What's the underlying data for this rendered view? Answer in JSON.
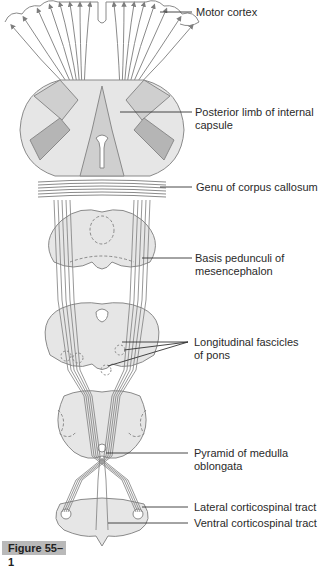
{
  "figure": {
    "caption": "Figure 55–1",
    "colors": {
      "outline": "#8a8a8a",
      "fill_light": "#e6e6e6",
      "fill_mid": "#cfcfcf",
      "fill_dark": "#b5b5b5",
      "fiber": "#7d7d7d",
      "leader_line": "#333333",
      "caption_bg": "#b9b9b9"
    }
  },
  "labels": [
    {
      "id": "motor-cortex",
      "text": "Motor cortex"
    },
    {
      "id": "posterior-limb",
      "text": "Posterior limb of internal",
      "text2": "capsule"
    },
    {
      "id": "genu",
      "text": "Genu of corpus callosum"
    },
    {
      "id": "basis-pedunculi",
      "text": "Basis pedunculi of",
      "text2": "mesencephalon"
    },
    {
      "id": "longitudinal-fascicles",
      "text": "Longitudinal fascicles",
      "text2": "of pons"
    },
    {
      "id": "pyramid",
      "text": "Pyramid of medulla",
      "text2": "oblongata"
    },
    {
      "id": "lateral-cst",
      "text": "Lateral corticospinal tract"
    },
    {
      "id": "ventral-cst",
      "text": "Ventral corticospinal tract"
    }
  ]
}
